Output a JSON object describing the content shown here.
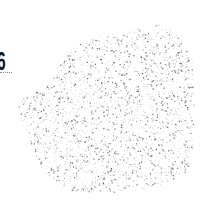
{
  "label": {
    "text": "6",
    "color": "#111111"
  },
  "underline": {
    "style": "dotted",
    "color": "#8a8a8a"
  },
  "stipple": {
    "dot_color_dark": "#555555",
    "dot_color_light": "#b0b0b0",
    "dot_count": 2600,
    "seed": 7,
    "outline": [
      [
        76,
        44
      ],
      [
        100,
        36
      ],
      [
        128,
        30
      ],
      [
        150,
        26
      ],
      [
        162,
        24
      ],
      [
        172,
        30
      ],
      [
        184,
        44
      ],
      [
        192,
        60
      ],
      [
        194,
        90
      ],
      [
        193,
        120
      ],
      [
        192,
        150
      ],
      [
        190,
        168
      ],
      [
        180,
        178
      ],
      [
        160,
        184
      ],
      [
        140,
        190
      ],
      [
        110,
        192
      ],
      [
        80,
        192
      ],
      [
        58,
        186
      ],
      [
        44,
        172
      ],
      [
        34,
        152
      ],
      [
        26,
        132
      ],
      [
        20,
        116
      ],
      [
        18,
        104
      ],
      [
        24,
        96
      ],
      [
        40,
        90
      ],
      [
        52,
        80
      ],
      [
        60,
        64
      ],
      [
        68,
        52
      ]
    ]
  }
}
